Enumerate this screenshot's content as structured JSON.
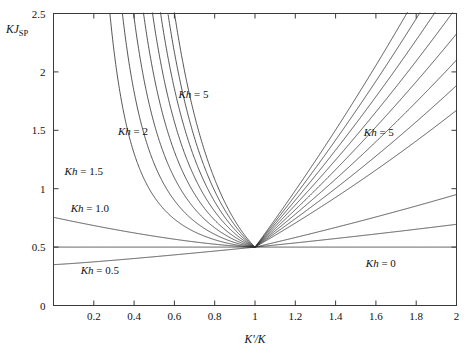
{
  "chart_data": {
    "type": "line",
    "title": "",
    "xlabel": "K'/K",
    "ylabel": "KJ_SP",
    "ylabel_main": "KJ",
    "ylabel_sub": "SP",
    "xlim": [
      0,
      2
    ],
    "ylim": [
      0,
      2.5
    ],
    "xticks": [
      0,
      0.2,
      0.4,
      0.6,
      0.8,
      1,
      1.2,
      1.4,
      1.6,
      1.8,
      2
    ],
    "xticklabels": [
      "",
      "0.2",
      "0.4",
      "0.6",
      "0.8",
      "1",
      "1.2",
      "1.4",
      "1.6",
      "1.8",
      "2"
    ],
    "yticks": [
      0,
      0.5,
      1,
      1.5,
      2,
      2.5
    ],
    "yticklabels": [
      "0",
      "0.5",
      "1",
      "1.5",
      "2",
      "2.5"
    ],
    "grid": false,
    "legend": "none",
    "line_color": "#2b2b2b",
    "axis_color": "#3a3a3a",
    "convergence_point": {
      "x": 1.0,
      "y": 0.5
    },
    "annotations": [
      {
        "text": "Kh = 5",
        "x": 0.62,
        "y": 1.78,
        "param": 5.0,
        "side": "left"
      },
      {
        "text": "Kh = 2",
        "x": 0.32,
        "y": 1.46,
        "param": 2.0,
        "side": "left"
      },
      {
        "text": "Kh = 1.5",
        "x": 0.055,
        "y": 1.12,
        "param": 1.5,
        "side": "left"
      },
      {
        "text": "Kh = 1.0",
        "x": 0.085,
        "y": 0.8,
        "param": 1.0,
        "side": "left"
      },
      {
        "text": "Kh = 0.5",
        "x": 0.135,
        "y": 0.27,
        "param": 0.5,
        "side": "left"
      },
      {
        "text": "Kh = 5",
        "x": 1.54,
        "y": 1.45,
        "param": 5.0,
        "side": "right"
      },
      {
        "text": "Kh = 0",
        "x": 1.55,
        "y": 0.33,
        "param": 0.0,
        "side": "right"
      }
    ],
    "series": [
      {
        "name": "Kh = 0",
        "param": 0.0,
        "values_note": "horizontal line at KJsp = 0.5"
      },
      {
        "name": "Kh = 0.5",
        "param": 0.5
      },
      {
        "name": "Kh = 1.0",
        "param": 1.0
      },
      {
        "name": "Kh = 1.5",
        "param": 1.5
      },
      {
        "name": "Kh = 2",
        "param": 2.0
      },
      {
        "name": "Kh = 2.5",
        "param": 2.5
      },
      {
        "name": "Kh = 3",
        "param": 3.0
      },
      {
        "name": "Kh = 3.5",
        "param": 3.5
      },
      {
        "name": "Kh = 4",
        "param": 4.0
      },
      {
        "name": "Kh = 4.5",
        "param": 4.5
      },
      {
        "name": "Kh = 5",
        "param": 5.0
      }
    ]
  }
}
